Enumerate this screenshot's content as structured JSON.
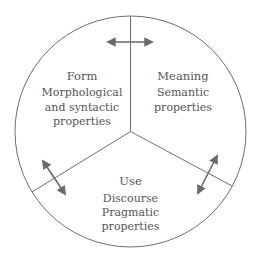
{
  "diagram": {
    "colors": {
      "stroke": "#6e6e6e",
      "arrow": "#6a6a6a",
      "text": "#555555",
      "background": "#ffffff"
    },
    "sections": {
      "form": {
        "title": "Form",
        "lines": [
          "Morphological",
          "and syntactic",
          "properties"
        ]
      },
      "meaning": {
        "title": "Meaning",
        "lines": [
          "Semantic",
          "properties"
        ]
      },
      "use": {
        "title": "Use",
        "lines": [
          "Discourse",
          "Pragmatic",
          "properties"
        ]
      }
    },
    "arrows": [
      {
        "name": "form-meaning-arrow",
        "type": "bidirectional"
      },
      {
        "name": "form-use-arrow",
        "type": "bidirectional"
      },
      {
        "name": "meaning-use-arrow",
        "type": "bidirectional"
      }
    ]
  }
}
